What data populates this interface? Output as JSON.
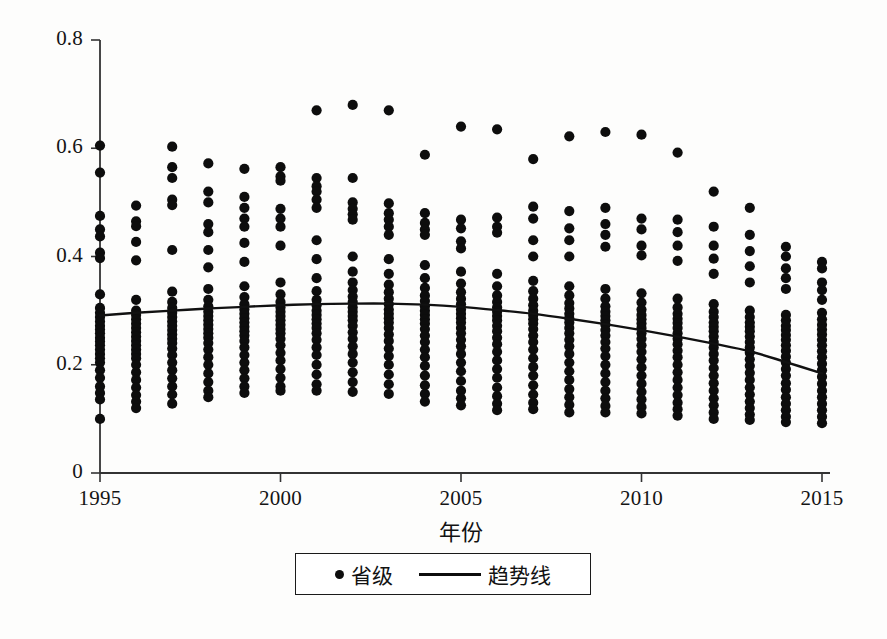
{
  "chart_data": {
    "type": "scatter",
    "title": "",
    "xlabel": "年份",
    "ylabel": "",
    "xlim": [
      1994.2,
      2015.8
    ],
    "ylim": [
      0,
      0.8
    ],
    "xticks": [
      "1995",
      "2000",
      "2005",
      "2010",
      "2015"
    ],
    "xtick_values": [
      1995,
      2000,
      2005,
      2010,
      2015
    ],
    "yticks": [
      "0",
      "0.2",
      "0.4",
      "0.6",
      "0.8"
    ],
    "ytick_values": [
      0,
      0.2,
      0.4,
      0.6,
      0.8
    ],
    "grid": false,
    "legend_position": "below-axes",
    "legend": [
      {
        "label": "省级",
        "marker": "dot"
      },
      {
        "label": "趋势线",
        "marker": "line"
      }
    ],
    "series": [
      {
        "name": "省级",
        "type": "scatter",
        "marker": "filled-circle",
        "color": "#0d0d0d",
        "points_by_year": [
          {
            "year": 1995,
            "values": [
              0.605,
              0.555,
              0.475,
              0.45,
              0.437,
              0.407,
              0.397,
              0.33,
              0.305,
              0.296,
              0.288,
              0.28,
              0.272,
              0.265,
              0.258,
              0.25,
              0.243,
              0.236,
              0.228,
              0.22,
              0.212,
              0.204,
              0.19,
              0.176,
              0.16,
              0.148,
              0.136,
              0.1
            ]
          },
          {
            "year": 1996,
            "values": [
              0.494,
              0.465,
              0.456,
              0.427,
              0.393,
              0.32,
              0.3,
              0.292,
              0.284,
              0.276,
              0.268,
              0.26,
              0.252,
              0.244,
              0.236,
              0.228,
              0.22,
              0.212,
              0.2,
              0.186,
              0.172,
              0.158,
              0.144,
              0.132,
              0.12
            ]
          },
          {
            "year": 1997,
            "values": [
              0.603,
              0.565,
              0.545,
              0.505,
              0.495,
              0.412,
              0.335,
              0.316,
              0.305,
              0.296,
              0.288,
              0.28,
              0.272,
              0.264,
              0.256,
              0.248,
              0.24,
              0.23,
              0.218,
              0.204,
              0.19,
              0.175,
              0.16,
              0.145,
              0.128
            ]
          },
          {
            "year": 1998,
            "values": [
              0.572,
              0.52,
              0.5,
              0.46,
              0.445,
              0.412,
              0.38,
              0.34,
              0.32,
              0.308,
              0.298,
              0.29,
              0.282,
              0.274,
              0.266,
              0.258,
              0.25,
              0.24,
              0.228,
              0.214,
              0.2,
              0.184,
              0.168,
              0.152,
              0.14
            ]
          },
          {
            "year": 1999,
            "values": [
              0.562,
              0.51,
              0.49,
              0.47,
              0.455,
              0.425,
              0.39,
              0.345,
              0.325,
              0.312,
              0.302,
              0.294,
              0.286,
              0.278,
              0.27,
              0.262,
              0.254,
              0.244,
              0.232,
              0.218,
              0.204,
              0.19,
              0.175,
              0.16,
              0.148
            ]
          },
          {
            "year": 2000,
            "values": [
              0.565,
              0.548,
              0.54,
              0.488,
              0.47,
              0.455,
              0.42,
              0.352,
              0.33,
              0.316,
              0.306,
              0.298,
              0.29,
              0.282,
              0.274,
              0.266,
              0.258,
              0.248,
              0.236,
              0.222,
              0.208,
              0.192,
              0.176,
              0.16,
              0.152
            ]
          },
          {
            "year": 2001,
            "values": [
              0.67,
              0.545,
              0.53,
              0.52,
              0.505,
              0.49,
              0.43,
              0.395,
              0.36,
              0.336,
              0.32,
              0.31,
              0.3,
              0.292,
              0.284,
              0.276,
              0.268,
              0.258,
              0.246,
              0.232,
              0.218,
              0.2,
              0.182,
              0.164,
              0.152
            ]
          },
          {
            "year": 2002,
            "values": [
              0.68,
              0.545,
              0.5,
              0.488,
              0.478,
              0.468,
              0.4,
              0.372,
              0.352,
              0.338,
              0.326,
              0.316,
              0.306,
              0.298,
              0.29,
              0.282,
              0.272,
              0.26,
              0.248,
              0.234,
              0.22,
              0.204,
              0.186,
              0.168,
              0.15
            ]
          },
          {
            "year": 2003,
            "values": [
              0.67,
              0.498,
              0.48,
              0.468,
              0.455,
              0.44,
              0.395,
              0.368,
              0.348,
              0.334,
              0.322,
              0.312,
              0.302,
              0.294,
              0.286,
              0.278,
              0.268,
              0.256,
              0.244,
              0.23,
              0.216,
              0.2,
              0.182,
              0.164,
              0.146
            ]
          },
          {
            "year": 2004,
            "values": [
              0.588,
              0.48,
              0.462,
              0.45,
              0.44,
              0.384,
              0.36,
              0.342,
              0.328,
              0.318,
              0.308,
              0.3,
              0.292,
              0.284,
              0.276,
              0.266,
              0.254,
              0.242,
              0.228,
              0.214,
              0.198,
              0.18,
              0.162,
              0.146,
              0.132
            ]
          },
          {
            "year": 2005,
            "values": [
              0.64,
              0.468,
              0.452,
              0.428,
              0.415,
              0.372,
              0.35,
              0.334,
              0.322,
              0.312,
              0.302,
              0.294,
              0.286,
              0.278,
              0.268,
              0.258,
              0.246,
              0.234,
              0.22,
              0.204,
              0.188,
              0.17,
              0.152,
              0.138,
              0.125
            ]
          },
          {
            "year": 2006,
            "values": [
              0.635,
              0.472,
              0.455,
              0.444,
              0.368,
              0.345,
              0.328,
              0.316,
              0.306,
              0.298,
              0.29,
              0.282,
              0.272,
              0.262,
              0.25,
              0.238,
              0.224,
              0.208,
              0.192,
              0.176,
              0.158,
              0.142,
              0.128,
              0.116
            ]
          },
          {
            "year": 2007,
            "values": [
              0.58,
              0.492,
              0.47,
              0.43,
              0.4,
              0.355,
              0.336,
              0.322,
              0.31,
              0.3,
              0.292,
              0.284,
              0.276,
              0.266,
              0.254,
              0.242,
              0.228,
              0.212,
              0.196,
              0.18,
              0.162,
              0.145,
              0.13,
              0.118
            ]
          },
          {
            "year": 2008,
            "values": [
              0.622,
              0.484,
              0.452,
              0.43,
              0.4,
              0.345,
              0.328,
              0.314,
              0.304,
              0.294,
              0.286,
              0.278,
              0.268,
              0.258,
              0.246,
              0.234,
              0.22,
              0.204,
              0.188,
              0.172,
              0.155,
              0.14,
              0.126,
              0.112
            ]
          },
          {
            "year": 2009,
            "values": [
              0.63,
              0.49,
              0.46,
              0.44,
              0.418,
              0.34,
              0.322,
              0.308,
              0.298,
              0.29,
              0.282,
              0.274,
              0.264,
              0.254,
              0.242,
              0.23,
              0.216,
              0.2,
              0.184,
              0.168,
              0.152,
              0.138,
              0.124,
              0.112
            ]
          },
          {
            "year": 2010,
            "values": [
              0.625,
              0.47,
              0.45,
              0.42,
              0.402,
              0.332,
              0.315,
              0.302,
              0.292,
              0.284,
              0.276,
              0.268,
              0.258,
              0.248,
              0.236,
              0.224,
              0.21,
              0.195,
              0.18,
              0.165,
              0.15,
              0.136,
              0.122,
              0.11
            ]
          },
          {
            "year": 2011,
            "values": [
              0.592,
              0.468,
              0.445,
              0.42,
              0.392,
              0.322,
              0.306,
              0.294,
              0.285,
              0.277,
              0.268,
              0.258,
              0.248,
              0.238,
              0.226,
              0.214,
              0.2,
              0.186,
              0.172,
              0.158,
              0.144,
              0.13,
              0.118,
              0.106
            ]
          },
          {
            "year": 2012,
            "values": [
              0.52,
              0.455,
              0.42,
              0.396,
              0.368,
              0.312,
              0.298,
              0.288,
              0.278,
              0.27,
              0.262,
              0.252,
              0.242,
              0.232,
              0.22,
              0.208,
              0.194,
              0.18,
              0.166,
              0.152,
              0.138,
              0.125,
              0.112,
              0.1
            ]
          },
          {
            "year": 2013,
            "values": [
              0.49,
              0.44,
              0.41,
              0.382,
              0.352,
              0.3,
              0.288,
              0.278,
              0.27,
              0.262,
              0.252,
              0.242,
              0.232,
              0.222,
              0.21,
              0.198,
              0.185,
              0.172,
              0.158,
              0.145,
              0.132,
              0.12,
              0.108,
              0.098
            ]
          },
          {
            "year": 2014,
            "values": [
              0.418,
              0.4,
              0.378,
              0.36,
              0.34,
              0.292,
              0.282,
              0.272,
              0.264,
              0.255,
              0.246,
              0.236,
              0.226,
              0.215,
              0.204,
              0.192,
              0.18,
              0.166,
              0.154,
              0.14,
              0.128,
              0.116,
              0.104,
              0.094
            ]
          },
          {
            "year": 2015,
            "values": [
              0.39,
              0.378,
              0.352,
              0.338,
              0.32,
              0.296,
              0.284,
              0.274,
              0.265,
              0.256,
              0.246,
              0.236,
              0.225,
              0.214,
              0.202,
              0.19,
              0.178,
              0.165,
              0.152,
              0.14,
              0.128,
              0.116,
              0.104,
              0.092
            ]
          }
        ]
      },
      {
        "name": "趋势线",
        "type": "line",
        "color": "#111111",
        "x": [
          1995,
          1996,
          1997,
          1998,
          1999,
          2000,
          2001,
          2002,
          2003,
          2004,
          2005,
          2006,
          2007,
          2008,
          2009,
          2010,
          2011,
          2012,
          2013,
          2014,
          2015
        ],
        "values": [
          0.291,
          0.296,
          0.3,
          0.304,
          0.307,
          0.31,
          0.312,
          0.313,
          0.313,
          0.311,
          0.307,
          0.301,
          0.294,
          0.285,
          0.275,
          0.264,
          0.252,
          0.239,
          0.225,
          0.205,
          0.184
        ]
      }
    ]
  },
  "axes_geometry": {
    "left_px": 100,
    "right_px": 822,
    "top_px": 40,
    "bottom_px": 473
  }
}
